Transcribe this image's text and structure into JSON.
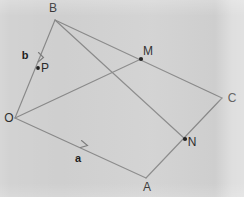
{
  "figure": {
    "kind": "vector-geometry-diagram",
    "background_color": "#d2d2d2",
    "line_color": "#8a8a8a",
    "label_color": "#2b2b2b",
    "width": 244,
    "height": 197,
    "vertices": [
      {
        "id": "O",
        "label": "O",
        "x": 15,
        "y": 118,
        "label_x": 9,
        "label_y": 122,
        "dot": false
      },
      {
        "id": "B",
        "label": "B",
        "x": 55,
        "y": 20,
        "label_x": 53,
        "label_y": 12,
        "dot": false
      },
      {
        "id": "C",
        "label": "C",
        "x": 222,
        "y": 98,
        "label_x": 232,
        "label_y": 102,
        "dot": false
      },
      {
        "id": "A",
        "label": "A",
        "x": 146,
        "y": 178,
        "label_x": 147,
        "label_y": 191,
        "dot": false
      }
    ],
    "points": [
      {
        "id": "P",
        "label": "P",
        "x": 38,
        "y": 68,
        "label_x": 45,
        "label_y": 72,
        "dot": true
      },
      {
        "id": "M",
        "label": "M",
        "x": 141,
        "y": 59,
        "label_x": 148,
        "label_y": 55,
        "dot": true
      },
      {
        "id": "N",
        "label": "N",
        "x": 185,
        "y": 139,
        "label_x": 192,
        "label_y": 146,
        "dot": true
      }
    ],
    "edges": [
      {
        "id": "O-A",
        "from": "O",
        "to": "A"
      },
      {
        "id": "A-C",
        "from": "A",
        "to": "C"
      },
      {
        "id": "C-B",
        "from": "C",
        "to": "B"
      },
      {
        "id": "B-O",
        "from": "B",
        "to": "O"
      },
      {
        "id": "O-M",
        "from": "O",
        "to": "M"
      },
      {
        "id": "B-N",
        "from": "B",
        "to": "N"
      }
    ],
    "vectors": [
      {
        "id": "a",
        "label": "a",
        "along": "O-A",
        "label_x": 78,
        "label_y": 162,
        "tick_x": 86,
        "tick_y": 145
      },
      {
        "id": "b",
        "label": "b",
        "along": "O-B",
        "label_x": 25,
        "label_y": 59,
        "tick_x": 43,
        "tick_y": 57
      }
    ]
  }
}
